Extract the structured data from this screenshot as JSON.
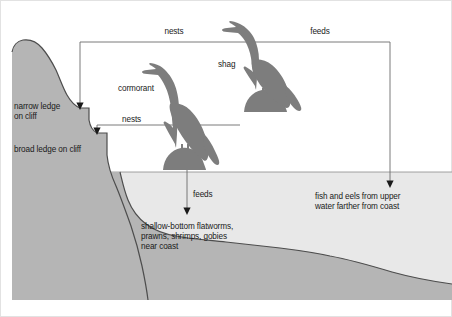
{
  "diagram": {
    "type": "ecology-habitat-cross-section",
    "colors": {
      "cliff_rock": "#b3b3b3",
      "seafloor": "#b3b3b3",
      "water": "#e6e6e6",
      "bird_silhouette": "#808080",
      "outline": "#4d4d4d",
      "connector_line": "#666666",
      "text": "#1a1a1a",
      "background": "#ffffff",
      "frame": "#e0e0e0"
    },
    "labels": {
      "nests_top": "nests",
      "feeds_top": "feeds",
      "shag": "shag",
      "cormorant": "cormorant",
      "nests_lower": "nests",
      "narrow_ledge": "narrow ledge\non cliff",
      "narrow_ledge_line1": "narrow ledge",
      "narrow_ledge_line2": "on cliff",
      "broad_ledge": "broad ledge on cliff",
      "feeds_lower": "feeds",
      "shallow_prey_line1": "shallow-bottom flatworms,",
      "shallow_prey_line2": "prawns, shrimps, gobies",
      "shallow_prey_line3": "near coast",
      "deep_prey_line1": "fish and eels from upper",
      "deep_prey_line2": "water farther from coast"
    },
    "species": [
      {
        "name": "shag",
        "nests_at": "narrow ledge on cliff",
        "feeds_on": "fish and eels from upper water farther from coast"
      },
      {
        "name": "cormorant",
        "nests_at": "broad ledge on cliff",
        "feeds_on": "shallow-bottom flatworms, prawns, shrimps, gobies near coast"
      }
    ]
  }
}
